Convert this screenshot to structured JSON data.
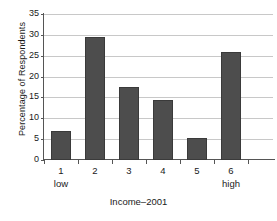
{
  "chart_data": {
    "type": "bar",
    "title": "",
    "xlabel": "Income–2001",
    "ylabel": "Percentage of Respondents",
    "categories": [
      "1",
      "2",
      "3",
      "4",
      "5",
      "6"
    ],
    "category_sublabels": [
      "low",
      "",
      "",
      "",
      "",
      "high"
    ],
    "values": [
      7.0,
      29.5,
      17.5,
      14.5,
      5.2,
      26.0
    ],
    "ylim": [
      0,
      35
    ],
    "ytick_labels": [
      "0",
      "5",
      "10",
      "15",
      "20",
      "25",
      "30",
      "35"
    ],
    "ytick_values": [
      0,
      5,
      10,
      15,
      20,
      25,
      30,
      35
    ],
    "grid": true,
    "legend": "none",
    "colors": {
      "bar_fill": "#4d4d4d",
      "bar_edge": "#3a3a3a",
      "gridline": "#c8c8c8",
      "axis": "#555555",
      "background": "#ffffff",
      "text": "#1a1a1a"
    }
  }
}
